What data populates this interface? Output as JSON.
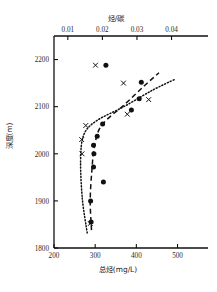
{
  "chart_data": {
    "type": "scatter",
    "title": "",
    "xlabel": "总烃(mg/L)",
    "xlabel_top": "烃/碳",
    "ylabel": "深度(m)",
    "xlim": [
      200,
      540
    ],
    "xlim_top": [
      0.006,
      0.0465
    ],
    "ylim": [
      2250,
      1800
    ],
    "grid": false,
    "legend": "none",
    "y_inverted": true,
    "xticks": [
      200,
      300,
      400,
      500
    ],
    "xticks_top": [
      0.01,
      0.02,
      0.03,
      0.04
    ],
    "yticks": [
      1800,
      1900,
      2000,
      2100,
      2200
    ],
    "xtick_labels": [
      "200",
      "300",
      "400",
      "500"
    ],
    "xtick_top_labels": [
      "0.01",
      "0.02",
      "0.03",
      "0.04"
    ],
    "ytick_labels": [
      "1800",
      "1900",
      "2000",
      "2100",
      "2200"
    ],
    "series": [
      {
        "name": "总烃(mg/L)",
        "marker": "filled-circle",
        "axis": "bottom",
        "points": [
          {
            "x": 290,
            "y": 1855
          },
          {
            "x": 289,
            "y": 1900
          },
          {
            "x": 320,
            "y": 1940
          },
          {
            "x": 296,
            "y": 1972
          },
          {
            "x": 297,
            "y": 2000
          },
          {
            "x": 296,
            "y": 2018
          },
          {
            "x": 305,
            "y": 2037
          },
          {
            "x": 318,
            "y": 2063
          },
          {
            "x": 388,
            "y": 2093
          },
          {
            "x": 407,
            "y": 2117
          },
          {
            "x": 412,
            "y": 2152
          },
          {
            "x": 326,
            "y": 2188
          }
        ]
      },
      {
        "name": "烃/碳",
        "marker": "x-cross",
        "axis": "top",
        "points": [
          {
            "x": 0.0165,
            "y": 1852
          },
          {
            "x": 0.0141,
            "y": 2000
          },
          {
            "x": 0.014,
            "y": 2030
          },
          {
            "x": 0.0152,
            "y": 2060
          },
          {
            "x": 0.0272,
            "y": 2084
          },
          {
            "x": 0.0334,
            "y": 2115
          },
          {
            "x": 0.0261,
            "y": 2150
          },
          {
            "x": 0.018,
            "y": 2188
          }
        ]
      }
    ],
    "trend_curves": [
      {
        "name": "dashed-trend",
        "style": "dashed",
        "axis": "bottom"
      },
      {
        "name": "dotted-trend",
        "style": "dotted",
        "axis": "top"
      }
    ]
  }
}
